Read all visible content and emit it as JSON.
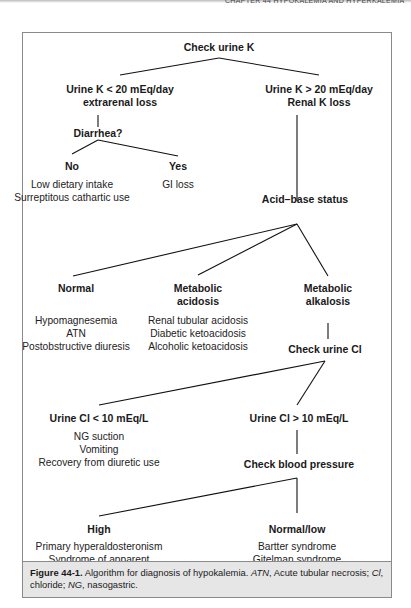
{
  "running_head": "CHAPTER 44 HYPOKALEMIA AND HYPERKALEMIA",
  "flowchart": {
    "root": "Check urine K",
    "low_urine_k": {
      "line1": "Urine K < 20 mEq/day",
      "line2": "extrarenal loss",
      "question": "Diarrhea?",
      "no": {
        "label": "No",
        "causes": [
          "Low dietary intake",
          "Surreptitous cathartic use"
        ]
      },
      "yes": {
        "label": "Yes",
        "causes": [
          "GI loss"
        ]
      }
    },
    "high_urine_k": {
      "line1": "Urine K > 20 mEq/day",
      "line2": "Renal K loss",
      "next": "Acid–base status"
    },
    "acid_base": {
      "normal": {
        "label": "Normal",
        "causes": [
          "Hypomagnesemia",
          "ATN",
          "Postobstructive diuresis"
        ]
      },
      "acidosis": {
        "line1": "Metabolic",
        "line2": "acidosis",
        "causes": [
          "Renal tubular acidosis",
          "Diabetic ketoacidosis",
          "Alcoholic ketoacidosis"
        ]
      },
      "alkalosis": {
        "line1": "Metabolic",
        "line2": "alkalosis",
        "next": "Check urine Cl"
      }
    },
    "urine_cl": {
      "low": {
        "label": "Urine Cl < 10 mEq/L",
        "causes": [
          "NG suction",
          "Vomiting",
          "Recovery from diuretic use"
        ]
      },
      "high": {
        "label": "Urine Cl > 10 mEq/L",
        "next": "Check blood pressure"
      }
    },
    "blood_pressure": {
      "high": {
        "label": "High",
        "causes": [
          "Primary hyperaldosteronism",
          "Syndrome of apparent",
          "mineralocorticoid excess",
          "Liddle syndrome"
        ]
      },
      "normal_low": {
        "label": "Normal/low",
        "causes": [
          "Bartter syndrome",
          "Gitelman syndrome"
        ]
      }
    }
  },
  "caption": {
    "figure_label": "Figure 44-1.",
    "text1": " Algorithm for diagnosis of hypokalemia. ",
    "abbr1": "ATN",
    "text2": ", Acute tubular necrosis; ",
    "abbr2": "Cl",
    "text3": ", chloride; ",
    "abbr3": "NG",
    "text4": ", nasogastric."
  }
}
